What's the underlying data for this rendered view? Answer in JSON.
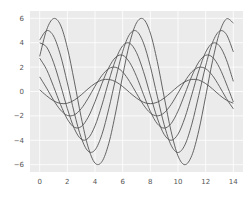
{
  "chart_data": {
    "type": "line",
    "title": "",
    "xlabel": "",
    "ylabel": "",
    "xlim": [
      -0.7,
      14.7
    ],
    "ylim": [
      -6.6,
      6.6
    ],
    "grid": true,
    "legend": null,
    "style": {
      "background": "#ebebeb",
      "grid_color": "#ffffff",
      "line_color": "#555555"
    },
    "xticks": [
      0,
      2,
      4,
      6,
      8,
      10,
      12,
      14
    ],
    "xtick_labels": [
      "0",
      "2",
      "4",
      "6",
      "8",
      "10",
      "12",
      "14"
    ],
    "yticks": [
      6,
      4,
      2,
      0,
      -2,
      -4,
      -6
    ],
    "ytick_labels": [
      "6",
      "4",
      "2",
      "0",
      "−2",
      "−4",
      "−6"
    ],
    "x": [
      0,
      0.5,
      1,
      1.5,
      2,
      2.5,
      3,
      3.5,
      4,
      4.5,
      5,
      5.5,
      6,
      6.5,
      7,
      7.5,
      8,
      8.5,
      9,
      9.5,
      10,
      10.5,
      11,
      11.5,
      12,
      12.5,
      13,
      13.5,
      14
    ],
    "series": [
      {
        "name": "line 1",
        "values": [
          2.88,
          5.05,
          5.98,
          5.46,
          3.59,
          0.85,
          -2.11,
          -4.54,
          -5.87,
          -5.75,
          -4.24,
          -1.68,
          1.29,
          3.94,
          5.63,
          5.94,
          4.79,
          2.47,
          -0.45,
          -3.26,
          -5.28,
          -6.0,
          -5.25,
          -3.22,
          -0.4,
          2.52,
          4.82,
          5.95,
          5.61
        ]
      },
      {
        "name": "line 2",
        "values": [
          4.21,
          4.99,
          4.55,
          2.99,
          0.71,
          -1.75,
          -3.78,
          -4.89,
          -4.79,
          -3.53,
          -1.4,
          1.07,
          3.28,
          4.69,
          4.95,
          3.99,
          2.06,
          -0.38,
          -2.72,
          -4.4,
          -5.0,
          -4.38,
          -2.68,
          -0.33,
          2.1,
          4.02,
          4.95,
          4.68,
          3.25
        ]
      },
      {
        "name": "line 3",
        "values": [
          3.99,
          3.64,
          2.39,
          0.56,
          -1.4,
          -3.03,
          -3.91,
          -3.84,
          -2.82,
          -1.12,
          0.86,
          2.63,
          3.75,
          3.96,
          3.19,
          1.65,
          -0.3,
          -2.18,
          -3.52,
          -4.0,
          -3.5,
          -2.15,
          -0.26,
          1.68,
          3.22,
          3.96,
          3.74,
          2.6,
          0.83
        ]
      },
      {
        "name": "line 4",
        "values": [
          2.73,
          1.8,
          0.42,
          -1.05,
          -2.27,
          -2.93,
          -2.88,
          -2.12,
          -0.84,
          0.65,
          1.97,
          2.81,
          2.97,
          2.39,
          1.24,
          -0.23,
          -1.63,
          -2.64,
          -3.0,
          -2.63,
          -1.61,
          -0.2,
          1.26,
          2.41,
          2.97,
          2.81,
          1.95,
          0.62,
          -0.86
        ]
      },
      {
        "name": "line 5",
        "values": [
          1.2,
          0.28,
          -0.7,
          -1.51,
          -1.96,
          -1.92,
          -1.41,
          -0.56,
          0.43,
          1.31,
          1.88,
          1.98,
          1.6,
          0.82,
          -0.15,
          -1.09,
          -1.76,
          -2.0,
          -1.75,
          -1.07,
          -0.13,
          0.84,
          1.61,
          1.98,
          1.87,
          1.3,
          0.41,
          -0.58,
          -1.42
        ]
      },
      {
        "name": "line 6",
        "values": [
          0.14,
          -0.35,
          -0.76,
          -0.98,
          -0.96,
          -0.71,
          -0.28,
          0.22,
          0.66,
          0.94,
          0.99,
          0.8,
          0.41,
          -0.08,
          -0.54,
          -0.88,
          -1.0,
          -0.88,
          -0.54,
          -0.07,
          0.42,
          0.8,
          0.99,
          0.94,
          0.65,
          0.21,
          -0.29,
          -0.71,
          -0.96
        ]
      }
    ]
  }
}
